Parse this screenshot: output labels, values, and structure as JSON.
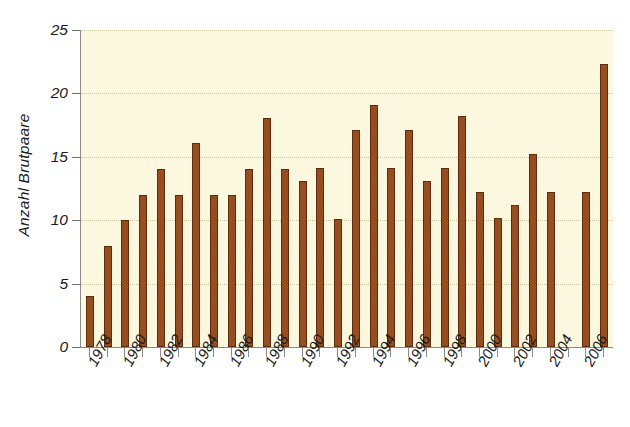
{
  "chart_data": {
    "type": "bar",
    "title": "",
    "subtitle": "",
    "xlabel": "",
    "ylabel": "Anzahl Brutpaare",
    "ylim": [
      0,
      25
    ],
    "ytick_labels": [
      "0",
      "5",
      "10",
      "15",
      "20",
      "25"
    ],
    "ytick_values": [
      0,
      5,
      10,
      15,
      20,
      25
    ],
    "grid": true,
    "legend": "none",
    "bar_color": "#9d4a18",
    "bar_edge_color": "#5c2c0c",
    "plot_background": "#fbf8df",
    "figure_background": "#ffffff",
    "axis_color": "#8a8a8a",
    "categories": [
      "1978",
      "1979",
      "1980",
      "1981",
      "1982",
      "1983",
      "1984",
      "1985",
      "1986",
      "1987",
      "1988",
      "1989",
      "1990",
      "1991",
      "1992",
      "1993",
      "1994",
      "1995",
      "1996",
      "1997",
      "1998",
      "1999",
      "2000",
      "2001",
      "2002",
      "2003",
      "2004",
      "2005",
      "2006",
      "2007"
    ],
    "values": [
      4,
      8,
      10,
      12,
      14,
      12,
      16.1,
      12,
      12,
      14,
      18.1,
      14,
      13.1,
      14.1,
      10.1,
      17.1,
      19.1,
      14.1,
      17.1,
      13.1,
      14.1,
      18.2,
      12.2,
      10.2,
      11.2,
      15.2,
      12.2,
      null,
      12.2,
      22.3
    ],
    "xtick_labels_shown": [
      "1978",
      "1980",
      "1982",
      "1984",
      "1986",
      "1988",
      "1990",
      "1992",
      "1994",
      "1996",
      "1998",
      "2000",
      "2002",
      "2004",
      "2006"
    ],
    "xtick_label_interval": 2,
    "xtick_label_rotation_deg": 62
  }
}
